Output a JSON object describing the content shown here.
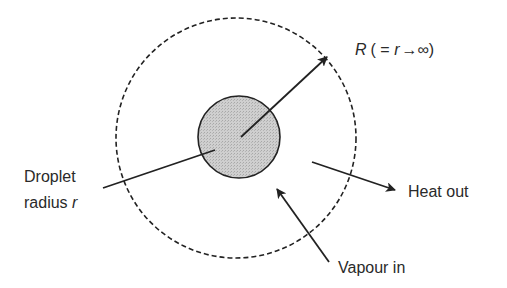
{
  "diagram": {
    "outer_boundary": {
      "style": "dashed",
      "center": [
        236,
        138
      ],
      "radius": 120
    },
    "droplet": {
      "center": [
        239,
        137
      ],
      "radius": 41,
      "fill": "#c8c8c8"
    },
    "labels": {
      "far_field_R": "R",
      "far_field_eq_open": "( = ",
      "far_field_r": "r",
      "far_field_arrow": "→",
      "far_field_inf": "∞)",
      "droplet_line1": "Droplet",
      "droplet_line2": "radius ",
      "droplet_r": "r",
      "heat": "Heat out",
      "vapour": "Vapour in"
    },
    "arrows": [
      {
        "name": "radius-R-arrow",
        "from": [
          241,
          137
        ],
        "to": [
          327,
          57
        ]
      },
      {
        "name": "heat-out-arrow",
        "from": [
          312,
          162
        ],
        "to": [
          395,
          190
        ]
      },
      {
        "name": "vapour-in-arrow",
        "from": [
          329,
          262
        ],
        "to": [
          277,
          189
        ]
      }
    ],
    "colors": {
      "stroke": "#222222",
      "droplet_fill": "#c8c8c8",
      "text": "#2a2a2a"
    }
  }
}
